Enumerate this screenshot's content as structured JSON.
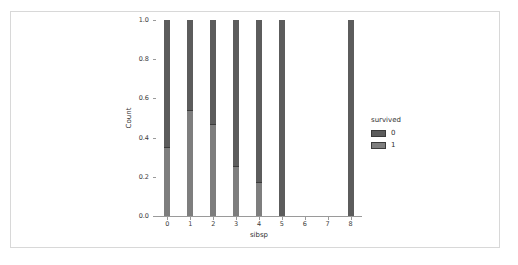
{
  "top_fragment": "",
  "chart_data": {
    "type": "bar",
    "title": "",
    "subtitle": "",
    "xlabel": "sibsp",
    "ylabel": "Count",
    "stacked": true,
    "normalized": true,
    "grid": false,
    "legend_position": "right",
    "legend_title": "survived",
    "xlim": [
      -0.5,
      8.5
    ],
    "ylim": [
      0.0,
      1.0
    ],
    "x": [
      0,
      1,
      2,
      3,
      4,
      5,
      6,
      7,
      8
    ],
    "categories": [
      "0",
      "1",
      "2",
      "3",
      "4",
      "5",
      "6",
      "7",
      "8"
    ],
    "xticks": [
      "0",
      "1",
      "2",
      "3",
      "4",
      "5",
      "6",
      "7",
      "8"
    ],
    "yticks": [
      "0.0",
      "0.2",
      "0.4",
      "0.6",
      "0.8",
      "1.0"
    ],
    "ytick_values": [
      0.0,
      0.2,
      0.4,
      0.6,
      0.8,
      1.0
    ],
    "series": [
      {
        "name": "1",
        "legend_label": "1",
        "color": "#7e7e7e",
        "values": [
          0.345,
          0.536,
          0.464,
          0.25,
          0.167,
          0.0,
          0.0,
          0.0,
          0.0
        ]
      },
      {
        "name": "0",
        "legend_label": "0",
        "color": "#5c5c5c",
        "values": [
          0.655,
          0.464,
          0.536,
          0.75,
          0.833,
          1.0,
          0.0,
          0.0,
          1.0
        ]
      }
    ],
    "bars_present": [
      true,
      true,
      true,
      true,
      true,
      true,
      false,
      false,
      true
    ],
    "colors": {
      "survived_0": "#5c5c5c",
      "survived_1": "#7e7e7e",
      "axis": "#9a9a9a",
      "text": "#2f2f2f",
      "card_border": "#d8d8d8"
    }
  }
}
